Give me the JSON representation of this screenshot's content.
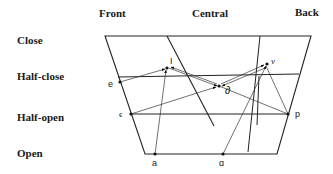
{
  "columns": {
    "front": "Front",
    "central": "Central",
    "back": "Back"
  },
  "rows": {
    "close": "Close",
    "half_close": "Half-close",
    "half_open": "Half-open",
    "open": "Open"
  },
  "points": {
    "e": "e",
    "I": "I",
    "schwa": "∂",
    "v": "v",
    "epsilon": "ϵ",
    "p": "p",
    "a": "a",
    "alpha": "ɑ"
  }
}
